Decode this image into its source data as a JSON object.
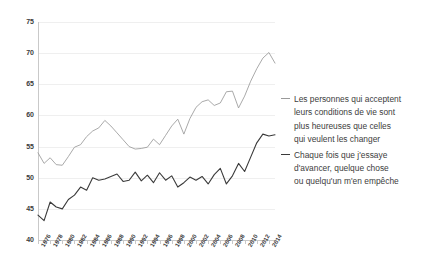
{
  "chart_data": {
    "type": "line",
    "title": "",
    "subtitle": "",
    "xlabel": "",
    "ylabel": "",
    "ylim": [
      40,
      75
    ],
    "yticks": [
      40,
      45,
      50,
      55,
      60,
      65,
      70,
      75
    ],
    "grid": true,
    "legend_position": "right",
    "x": [
      1976,
      1977,
      1978,
      1979,
      1980,
      1981,
      1982,
      1983,
      1984,
      1985,
      1986,
      1987,
      1988,
      1989,
      1990,
      1991,
      1992,
      1993,
      1994,
      1995,
      1996,
      1997,
      1998,
      1999,
      2000,
      2001,
      2002,
      2003,
      2004,
      2005,
      2006,
      2007,
      2008,
      2009,
      2010,
      2011,
      2012,
      2013,
      2014,
      2015
    ],
    "xtick_labels": [
      "1976",
      "1978",
      "1980",
      "1982",
      "1984",
      "1986",
      "1988",
      "1990",
      "1992",
      "1994",
      "1996",
      "1998",
      "2000",
      "2002",
      "2004",
      "2006",
      "2008",
      "2010",
      "2012",
      "2014"
    ],
    "series": [
      {
        "name": "Les personnes qui acceptent leurs conditions de vie sont plus heureuses que celles qui veulent les changer",
        "color": "#9a9a9a",
        "values": [
          54.0,
          52.3,
          53.2,
          52.1,
          52.0,
          53.4,
          54.9,
          55.3,
          56.6,
          57.5,
          58.0,
          59.2,
          58.3,
          57.2,
          56.1,
          55.0,
          54.6,
          54.7,
          54.9,
          56.2,
          55.3,
          56.8,
          58.3,
          59.4,
          57.0,
          59.5,
          61.3,
          62.2,
          62.5,
          61.6,
          62.0,
          63.8,
          63.9,
          61.2,
          63.1,
          65.5,
          67.5,
          69.2,
          70.1,
          68.4
        ]
      },
      {
        "name": "Chaque fois que j'essaye d'avancer, quelque chose ou quelqu'un m'en empêche",
        "color": "#3a3a3a",
        "values": [
          44.0,
          43.1,
          46.1,
          45.3,
          45.0,
          46.5,
          47.2,
          48.5,
          48.0,
          50.0,
          49.6,
          49.8,
          50.2,
          50.6,
          49.4,
          49.6,
          50.9,
          49.5,
          50.4,
          49.2,
          50.8,
          49.6,
          50.3,
          48.5,
          49.2,
          50.1,
          49.6,
          50.2,
          49.0,
          50.5,
          51.5,
          49.0,
          50.3,
          52.3,
          51.0,
          53.3,
          55.6,
          57.0,
          56.7,
          56.9
        ]
      }
    ]
  },
  "legend": {
    "items": [
      {
        "color": "#9a9a9a",
        "lines": [
          "Les personnes qui acceptent",
          "leurs conditions de vie sont",
          "plus heureuses que celles",
          "qui veulent les changer"
        ]
      },
      {
        "color": "#3a3a3a",
        "lines": [
          "Chaque fois que j'essaye",
          "d'avancer, quelque chose",
          "ou quelqu'un m'en empêche"
        ]
      }
    ]
  }
}
